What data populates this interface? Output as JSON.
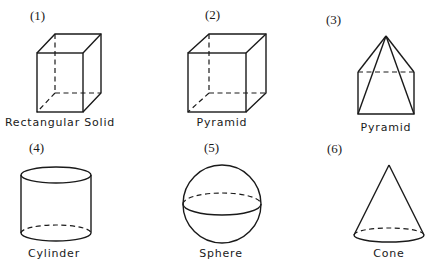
{
  "figure": {
    "shapes": [
      {
        "number": "(1)",
        "name": "Rectangular Solid"
      },
      {
        "number": "(2)",
        "name": "Cube"
      },
      {
        "number": "(3)",
        "name": "Pyramid"
      },
      {
        "number": "(4)",
        "name": "Cylinder"
      },
      {
        "number": "(5)",
        "name": "Sphere"
      },
      {
        "number": "(6)",
        "name": "Cone"
      }
    ],
    "stroke_color": "#1a1a1a",
    "background": "#ffffff"
  }
}
